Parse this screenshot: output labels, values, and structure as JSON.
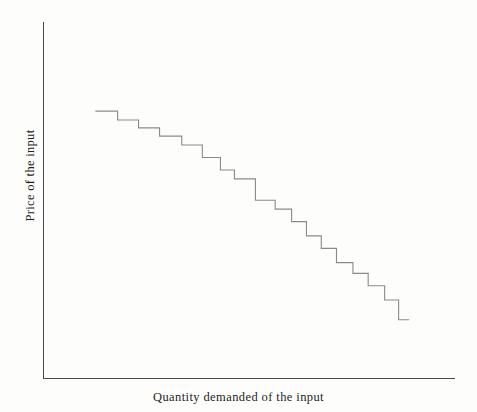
{
  "chart_data": {
    "type": "line",
    "title": "",
    "subtitle": "",
    "xlabel": "Quantity demanded of the input",
    "ylabel": "Price of the input",
    "grid": false,
    "legend": null,
    "annotations": [],
    "axis_style": "open-L",
    "curve_style": "step-descending",
    "curve_color": "#8a8a8a",
    "axis_color": "#4a4a4a",
    "xlim": [
      0,
      100
    ],
    "ylim": [
      0,
      100
    ],
    "series": [
      {
        "name": "Derived demand for the input",
        "step_type": "hv",
        "x": [
          12.6,
          18.0,
          18.0,
          23.1,
          23.1,
          28.2,
          28.2,
          33.6,
          33.6,
          38.6,
          38.6,
          43.0,
          43.0,
          46.4,
          46.4,
          51.5,
          51.5,
          56.3,
          56.3,
          60.3,
          60.3,
          63.9,
          63.9,
          67.5,
          67.5,
          71.2,
          71.2,
          75.2,
          75.2,
          78.9,
          78.9,
          82.9,
          82.9,
          86.3,
          86.3,
          88.9
        ],
        "y": [
          75.0,
          75.0,
          72.5,
          72.5,
          70.3,
          70.3,
          68.0,
          68.0,
          65.5,
          65.5,
          62.0,
          62.0,
          58.5,
          58.5,
          56.0,
          56.0,
          50.0,
          50.0,
          47.5,
          47.5,
          44.0,
          44.0,
          40.0,
          40.0,
          36.5,
          36.5,
          32.5,
          32.5,
          29.5,
          29.5,
          26.0,
          26.0,
          22.0,
          22.0,
          16.5,
          16.5
        ],
        "n_steps": 24,
        "start_point": {
          "x": 12.6,
          "y": 75.0
        },
        "end_point": {
          "x": 88.9,
          "y": 16.5
        }
      }
    ]
  },
  "labels": {
    "y_axis_label": "Price of the input",
    "x_axis_label": "Quantity demanded of the input"
  }
}
